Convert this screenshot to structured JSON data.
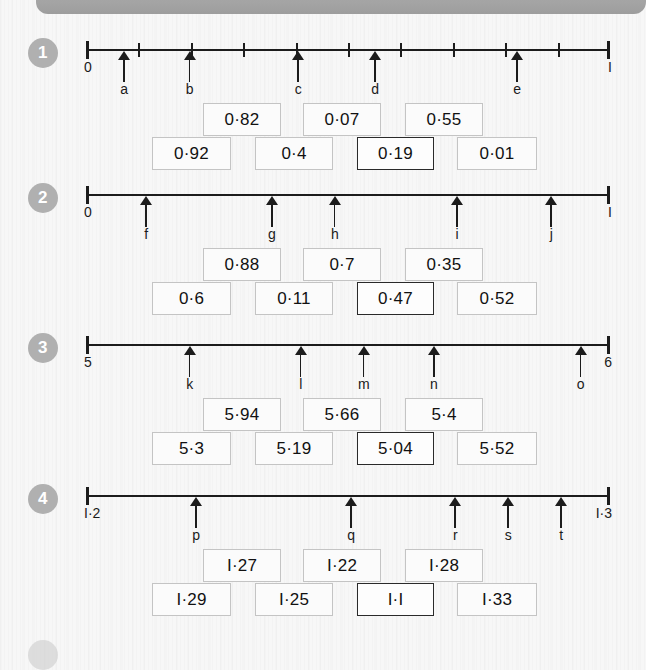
{
  "page": {
    "background": "#f7f7f7",
    "header_bar_color": "#a4a4a4",
    "badge_color": "#b0b0b0",
    "box_border_color": "#c4c4c4",
    "box_border_highlight_color": "#2a2a2a",
    "axis_color": "#1c1c1c"
  },
  "exercises": [
    {
      "number": "1",
      "line": {
        "start_label": "0",
        "end_label": "I",
        "ticks": [
          0,
          0.1,
          0.2,
          0.3,
          0.4,
          0.5,
          0.6,
          0.7,
          0.8,
          0.9,
          1
        ],
        "show_inner_ticks": true
      },
      "pointers": [
        {
          "label": "a",
          "pos": 0.073
        },
        {
          "label": "b",
          "pos": 0.198
        },
        {
          "label": "c",
          "pos": 0.405
        },
        {
          "label": "d",
          "pos": 0.552
        },
        {
          "label": "e",
          "pos": 0.823
        }
      ],
      "boxes_top": [
        {
          "value": "0·82",
          "highlight": false
        },
        {
          "value": "0·07",
          "highlight": false
        },
        {
          "value": "0·55",
          "highlight": false
        }
      ],
      "boxes_bottom": [
        {
          "value": "0·92",
          "highlight": false
        },
        {
          "value": "0·4",
          "highlight": false
        },
        {
          "value": "0·19",
          "highlight": true
        },
        {
          "value": "0·01",
          "highlight": false
        }
      ]
    },
    {
      "number": "2",
      "line": {
        "start_label": "0",
        "end_label": "I",
        "ticks": [],
        "show_inner_ticks": false
      },
      "pointers": [
        {
          "label": "f",
          "pos": 0.115
        },
        {
          "label": "g",
          "pos": 0.355
        },
        {
          "label": "h",
          "pos": 0.475
        },
        {
          "label": "i",
          "pos": 0.708
        },
        {
          "label": "j",
          "pos": 0.888
        }
      ],
      "boxes_top": [
        {
          "value": "0·88",
          "highlight": false
        },
        {
          "value": "0·7",
          "highlight": false
        },
        {
          "value": "0·35",
          "highlight": false
        }
      ],
      "boxes_bottom": [
        {
          "value": "0·6",
          "highlight": false
        },
        {
          "value": "0·11",
          "highlight": false
        },
        {
          "value": "0·47",
          "highlight": true
        },
        {
          "value": "0·52",
          "highlight": false
        }
      ]
    },
    {
      "number": "3",
      "line": {
        "start_label": "5",
        "end_label": "6",
        "ticks": [],
        "show_inner_ticks": false
      },
      "pointers": [
        {
          "label": "k",
          "pos": 0.198
        },
        {
          "label": "l",
          "pos": 0.41
        },
        {
          "label": "m",
          "pos": 0.53
        },
        {
          "label": "n",
          "pos": 0.664
        },
        {
          "label": "o",
          "pos": 0.944
        }
      ],
      "boxes_top": [
        {
          "value": "5·94",
          "highlight": false
        },
        {
          "value": "5·66",
          "highlight": false
        },
        {
          "value": "5·4",
          "highlight": false
        }
      ],
      "boxes_bottom": [
        {
          "value": "5·3",
          "highlight": false
        },
        {
          "value": "5·19",
          "highlight": false
        },
        {
          "value": "5·04",
          "highlight": true
        },
        {
          "value": "5·52",
          "highlight": false
        }
      ]
    },
    {
      "number": "4",
      "line": {
        "start_label": "I·2",
        "end_label": "I·3",
        "ticks": [],
        "show_inner_ticks": false
      },
      "pointers": [
        {
          "label": "p",
          "pos": 0.21
        },
        {
          "label": "q",
          "pos": 0.506
        },
        {
          "label": "r",
          "pos": 0.705
        },
        {
          "label": "s",
          "pos": 0.806
        },
        {
          "label": "t",
          "pos": 0.907
        }
      ],
      "boxes_top": [
        {
          "value": "I·27",
          "highlight": false
        },
        {
          "value": "I·22",
          "highlight": false
        },
        {
          "value": "I·28",
          "highlight": false
        }
      ],
      "boxes_bottom": [
        {
          "value": "I·29",
          "highlight": false
        },
        {
          "value": "I·25",
          "highlight": false
        },
        {
          "value": "I·I",
          "highlight": true
        },
        {
          "value": "I·33",
          "highlight": false
        }
      ]
    }
  ],
  "layout": {
    "row_tops": [
      38,
      183,
      333,
      484
    ],
    "line_top_offset": 11,
    "boxes_top_offset": 65,
    "boxes_bottom_offset": 99,
    "top_box_lefts": [
      203,
      303,
      405
    ],
    "top_box_widths": [
      78,
      78,
      78
    ],
    "bottom_box_lefts": [
      152,
      255,
      357,
      457
    ],
    "bottom_box_widths": [
      79,
      78,
      77,
      80
    ]
  }
}
